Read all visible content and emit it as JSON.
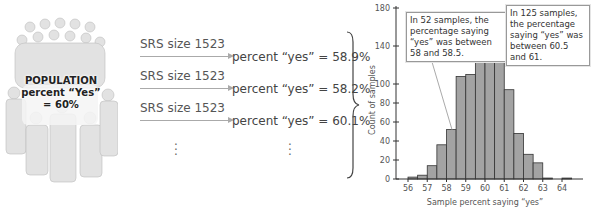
{
  "population": {
    "line1": "POPULATION",
    "line2": "percent “Yes”",
    "line3": "= 60%"
  },
  "samples": [
    {
      "label": "SRS size 1523",
      "result": "percent “yes” = 58.9%"
    },
    {
      "label": "SRS size 1523",
      "result": "percent “yes” = 58.2%"
    },
    {
      "label": "SRS size 1523",
      "result": "percent “yes” = 60.1%"
    }
  ],
  "ellipsis": "⋮",
  "annotations": {
    "left": "In 52 samples, the percentage saying “yes” was between 58 and 58.5.",
    "right": "In 125 samples, the percentage saying “yes” was between 60.5 and 61."
  },
  "chart_data": {
    "type": "bar",
    "title": "",
    "xlabel": "Sample percent saying “yes”",
    "ylabel": "Count of samples",
    "bin_width": 0.5,
    "bin_starts": [
      56,
      56.5,
      57,
      57.5,
      58,
      58.5,
      59,
      59.5,
      60,
      60.5,
      61,
      61.5,
      62,
      62.5,
      63,
      63.5,
      64
    ],
    "values": [
      2,
      4,
      14,
      36,
      52,
      108,
      110,
      176,
      166,
      125,
      94,
      48,
      26,
      17,
      1,
      0,
      1
    ],
    "xticks": [
      56,
      57,
      58,
      59,
      60,
      61,
      62,
      63,
      64
    ],
    "yticks": [
      0,
      20,
      40,
      60,
      80,
      100,
      140,
      180
    ],
    "ylim": [
      0,
      180
    ],
    "xlim": [
      55.5,
      65
    ],
    "grid": false,
    "bar_color": "#a3a3a3",
    "edge_color": "#333333"
  }
}
